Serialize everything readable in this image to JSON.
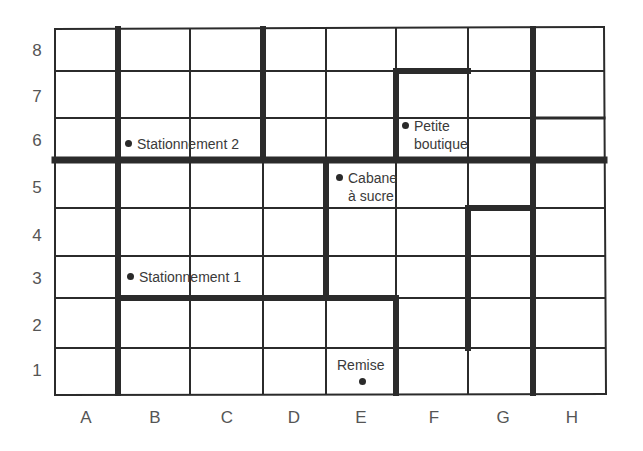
{
  "map": {
    "columns": [
      "A",
      "B",
      "C",
      "D",
      "E",
      "F",
      "G",
      "H"
    ],
    "rows": [
      "8",
      "7",
      "6",
      "5",
      "4",
      "3",
      "2",
      "1"
    ],
    "line_color": "#2b2b2b",
    "places": [
      {
        "id": "stationnement-2",
        "label": "Stationnement 2",
        "cell": "B6"
      },
      {
        "id": "petite-boutique",
        "label_line1": "Petite",
        "label_line2": "boutique",
        "cell": "F6"
      },
      {
        "id": "cabane-a-sucre",
        "label_line1": "Cabane",
        "label_line2": "à sucre",
        "cell": "E5"
      },
      {
        "id": "stationnement-1",
        "label": "Stationnement 1",
        "cell": "B3"
      },
      {
        "id": "remise",
        "label": "Remise",
        "cell": "E1"
      }
    ]
  }
}
